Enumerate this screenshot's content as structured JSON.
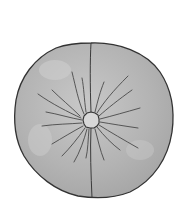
{
  "image": {
    "subject": "round cushion with center button and radiating pleats",
    "caption": "Round tufted cushion illustration"
  },
  "colors": {
    "background": "#ffffff",
    "cushion_fill": "#b4b4b4",
    "cushion_highlight": "#cdcdcd",
    "outline": "#333333",
    "pleat": "#4a4a4a",
    "button_fill": "#d6d6d6"
  },
  "geometry": {
    "center": [
      91,
      120
    ],
    "radius_x": 79,
    "radius_y": 78,
    "button_radius": 8
  }
}
